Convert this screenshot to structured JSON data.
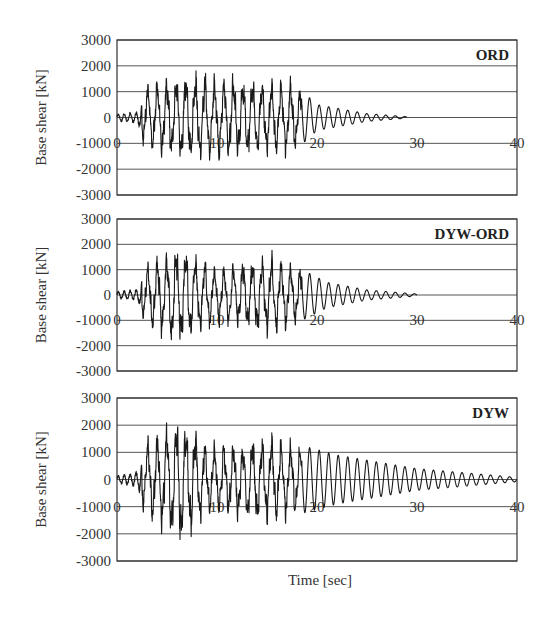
{
  "figure": {
    "xlabel": "Time [sec]",
    "ylabel": "Base shear [kN]"
  },
  "chart_data": [
    {
      "type": "line",
      "title": "ORD",
      "xlabel": "Time [sec]",
      "ylabel": "Base shear [kN]",
      "xlim": [
        0,
        40
      ],
      "ylim": [
        -3000,
        3000
      ],
      "xticks": [
        0,
        10,
        20,
        30,
        40
      ],
      "yticks": [
        3000,
        2000,
        1000,
        0,
        -1000,
        -2000,
        -3000
      ],
      "grid": true,
      "series": [
        {
          "name": "ORD",
          "duration": 29,
          "peak_positive": 1850,
          "peak_negative": -1650,
          "envelope": {
            "t": [
              0,
              2,
              3,
              8,
              14,
              17.5,
              20,
              25,
              29
            ],
            "amp": [
              200,
              300,
              1300,
              1700,
              1400,
              1400,
              500,
              150,
              30
            ]
          },
          "description": "Strong shaking 3–18 s, free-vibration decay to ~29 s"
        }
      ]
    },
    {
      "type": "line",
      "title": "DYW-ORD",
      "xlabel": "Time [sec]",
      "ylabel": "Base shear [kN]",
      "xlim": [
        0,
        40
      ],
      "ylim": [
        -3000,
        3000
      ],
      "xticks": [
        0,
        10,
        20,
        30,
        40
      ],
      "yticks": [
        3000,
        2000,
        1000,
        0,
        -1000,
        -2000,
        -3000
      ],
      "grid": true,
      "series": [
        {
          "name": "DYW-ORD",
          "duration": 30,
          "peak_positive": 2100,
          "peak_negative": -1900,
          "envelope": {
            "t": [
              0,
              2,
              3,
              6,
              10,
              15.5,
              18,
              21,
              25,
              30
            ],
            "amp": [
              200,
              300,
              1200,
              1900,
              1100,
              1500,
              1100,
              500,
              200,
              40
            ]
          },
          "description": "Strong shaking 3–18 s, free-vibration decay to ~30 s"
        }
      ]
    },
    {
      "type": "line",
      "title": "DYW",
      "xlabel": "Time [sec]",
      "ylabel": "Base shear [kN]",
      "xlim": [
        0,
        40
      ],
      "ylim": [
        -3000,
        3000
      ],
      "xticks": [
        0,
        10,
        20,
        30,
        40
      ],
      "yticks": [
        3000,
        2000,
        1000,
        0,
        -1000,
        -2000,
        -3000
      ],
      "grid": true,
      "series": [
        {
          "name": "DYW",
          "duration": 40,
          "peak_positive": 2600,
          "peak_negative": -2300,
          "envelope": {
            "t": [
              0,
              2,
              3,
              6.5,
              9,
              15.5,
              18,
              22,
              30,
              40
            ],
            "amp": [
              200,
              400,
              1400,
              2400,
              1200,
              1600,
              1300,
              900,
              400,
              80
            ]
          },
          "description": "Strong shaking 3–18 s, long lightly-damped free-vibration tail to 40 s"
        }
      ]
    }
  ]
}
